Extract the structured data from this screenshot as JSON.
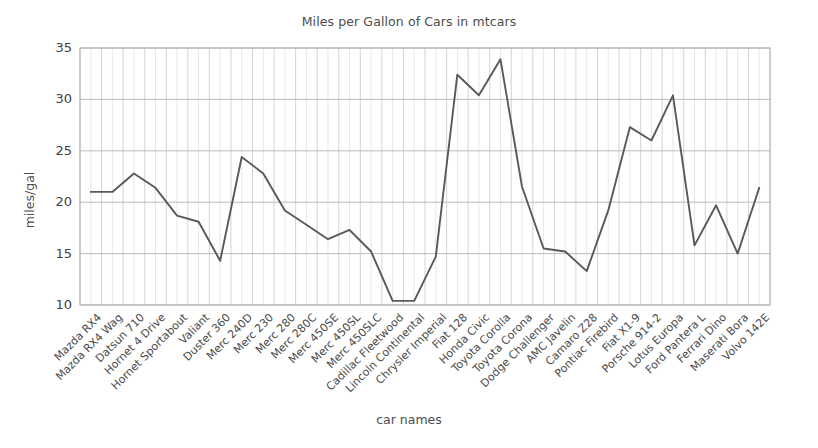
{
  "chart_data": {
    "type": "line",
    "title": "Miles per Gallon of Cars in mtcars",
    "xlabel": "car names",
    "ylabel": "miles/gal",
    "ylim": [
      10,
      35
    ],
    "yticks": [
      10,
      15,
      20,
      25,
      30,
      35
    ],
    "grid": true,
    "legend": "none",
    "line_color": "#595959",
    "grid_color": "#c8c8c8",
    "background": "#ffffff",
    "categories": [
      "Mazda RX4",
      "Mazda RX4 Wag",
      "Datsun 710",
      "Hornet 4 Drive",
      "Hornet Sportabout",
      "Valiant",
      "Duster 360",
      "Merc 240D",
      "Merc 230",
      "Merc 280",
      "Merc 280C",
      "Merc 450SE",
      "Merc 450SL",
      "Merc 450SLC",
      "Cadillac Fleetwood",
      "Lincoln Continental",
      "Chrysler Imperial",
      "Fiat 128",
      "Honda Civic",
      "Toyota Corolla",
      "Toyota Corona",
      "Dodge Challenger",
      "AMC Javelin",
      "Camaro Z28",
      "Pontiac Firebird",
      "Fiat X1-9",
      "Porsche 914-2",
      "Lotus Europa",
      "Ford Pantera L",
      "Ferrari Dino",
      "Maserati Bora",
      "Volvo 142E"
    ],
    "values": [
      21.0,
      21.0,
      22.8,
      21.4,
      18.7,
      18.1,
      14.3,
      24.4,
      22.8,
      19.2,
      17.8,
      16.4,
      17.3,
      15.2,
      10.4,
      10.4,
      14.7,
      32.4,
      30.4,
      33.9,
      21.5,
      15.5,
      15.2,
      13.3,
      19.2,
      27.3,
      26.0,
      30.4,
      15.8,
      19.7,
      15.0,
      21.4
    ]
  },
  "layout": {
    "plot_left": 80,
    "plot_right": 770,
    "plot_top": 48,
    "plot_bottom": 305
  }
}
